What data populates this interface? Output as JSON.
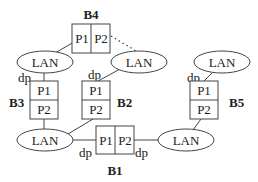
{
  "bridges": {
    "b1": {
      "label": "B1",
      "port1": "P1",
      "port2": "P2"
    },
    "b2": {
      "label": "B2",
      "port1": "P1",
      "port2": "P2"
    },
    "b3": {
      "label": "B3",
      "port1": "P1",
      "port2": "P2"
    },
    "b4": {
      "label": "B4",
      "port1": "P1",
      "port2": "P2"
    },
    "b5": {
      "label": "B5",
      "port1": "P1",
      "port2": "P2"
    }
  },
  "lans": {
    "top_left": "LAN",
    "top_middle": "LAN",
    "top_right": "LAN",
    "bottom_left": "LAN",
    "bottom_right": "LAN"
  },
  "designated_ports": {
    "b3_p1": "dp",
    "b2_p1": "dp",
    "b5_p1": "dp",
    "b1_p1": "dp",
    "b1_p2": "dp"
  }
}
